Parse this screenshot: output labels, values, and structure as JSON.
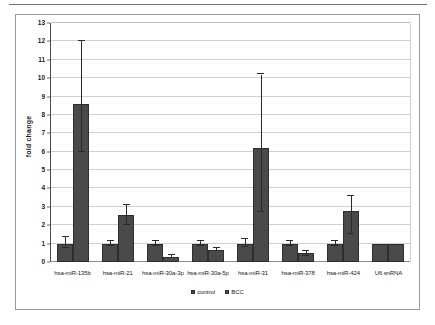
{
  "chart_data": {
    "type": "bar",
    "title": "",
    "xlabel": "",
    "ylabel": "fold change",
    "ylim": [
      0,
      13
    ],
    "ytick_step": 1,
    "yticks": [
      0,
      1,
      2,
      3,
      4,
      5,
      6,
      7,
      8,
      9,
      10,
      11,
      12,
      13
    ],
    "grid": true,
    "legend_position": "bottom",
    "bar_color": "#4a4a4a",
    "categories": [
      "hsa-miR-135b",
      "hsa-miR-21",
      "hsa-miR-30a-3p",
      "hsa-miR-30a-5p",
      "hsa-miR-31",
      "hsa-miR-378",
      "hsa-miR-424",
      "U6 snRNA"
    ],
    "series": [
      {
        "name": "control",
        "values": [
          1.0,
          1.0,
          1.0,
          1.0,
          1.0,
          1.0,
          1.0,
          1.0
        ],
        "err_low": [
          0.75,
          0.85,
          0.85,
          0.85,
          0.8,
          0.85,
          0.85,
          null
        ],
        "err_high": [
          1.35,
          1.15,
          1.15,
          1.12,
          1.25,
          1.15,
          1.12,
          null
        ]
      },
      {
        "name": "BCC",
        "values": [
          8.6,
          2.55,
          0.26,
          0.68,
          6.2,
          0.5,
          2.75,
          1.0
        ],
        "err_low": [
          6.0,
          2.0,
          null,
          null,
          2.7,
          0.32,
          1.55,
          null
        ],
        "err_high": [
          12.0,
          3.1,
          0.36,
          0.78,
          10.2,
          0.62,
          3.6,
          null
        ]
      }
    ]
  }
}
